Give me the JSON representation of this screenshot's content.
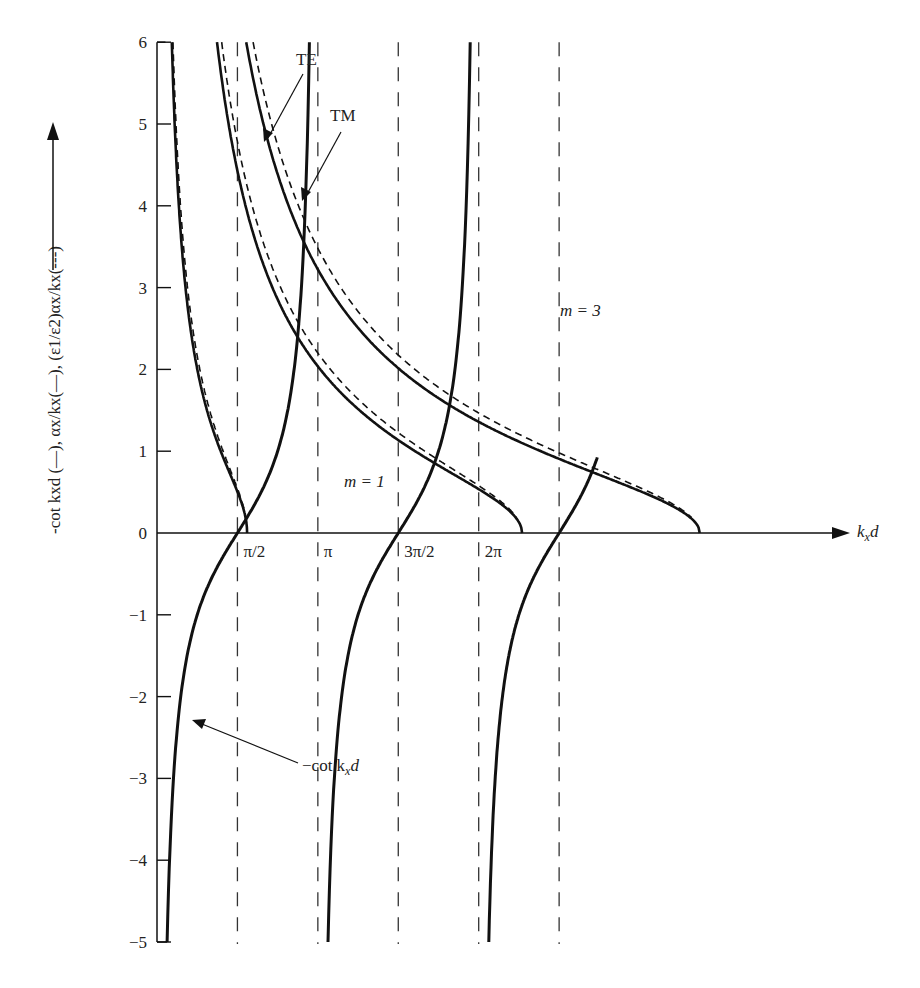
{
  "chart_data": {
    "type": "line",
    "title": "",
    "xlabel": "k_x d",
    "ylabel": "-cot k_x d (—), α_x/k_x(—), (ε1/ε2)α_x/k_x(---)",
    "ylim": [
      -5,
      6
    ],
    "xlim": [
      0,
      8.6
    ],
    "grid": false,
    "y_ticks": [
      "6",
      "5",
      "4",
      "3",
      "2",
      "1",
      "0",
      "−1",
      "−2",
      "−3",
      "−4",
      "−5"
    ],
    "y_tick_values": [
      6,
      5,
      4,
      3,
      2,
      1,
      0,
      -1,
      -2,
      -3,
      -4,
      -5
    ],
    "x_ticks": [
      "π/2",
      "π",
      "3π/2",
      "2π"
    ],
    "x_tick_values": [
      1.5708,
      3.1416,
      4.7124,
      6.2832
    ],
    "asymptotes_dashed_at": [
      1.5708,
      3.1416,
      4.7124,
      6.2832,
      7.854
    ],
    "series": [
      {
        "name": "-cot k_x d",
        "style": "solid-thick",
        "description": "branches between poles at 0, π, 2π, 3π"
      },
      {
        "name": "α_x/k_x (TE), V≈1.76",
        "style": "solid",
        "ends_at_x": 1.76
      },
      {
        "name": "(ε1/ε2)α_x/k_x (TM), V≈1.76",
        "style": "dashed",
        "ends_at_x": 1.76
      },
      {
        "name": "α_x/k_x (TE), V≈7.13",
        "style": "solid",
        "ends_at_x": 7.13
      },
      {
        "name": "(ε1/ε2)α_x/k_x (TM), V≈7.13",
        "style": "dashed",
        "ends_at_x": 7.13
      },
      {
        "name": "α_x/k_x (TE), V≈10.6",
        "style": "solid",
        "ends_at_x": 10.6
      },
      {
        "name": "(ε1/ε2)α_x/k_x (TM), V≈10.6",
        "style": "dashed",
        "ends_at_x": 10.6
      }
    ],
    "annotations": [
      {
        "text": "TE",
        "points_to": "solid decaying curve"
      },
      {
        "text": "TM",
        "points_to": "dashed decaying curve"
      },
      {
        "text": "m = 1",
        "region": "between π/2 and π"
      },
      {
        "text": "m = 3",
        "region": "between 3π/2 and 2π"
      },
      {
        "text": "−cot k_x d",
        "points_to": "first -cot branch"
      }
    ]
  },
  "labels": {
    "y_axis_title": "-cot k",
    "y_axis_title_full": "-cot kxd (—), αx/kx(—), (ε1/ε2)αx/kx(---)",
    "x_axis_title_k": "k",
    "x_axis_title_sub": "x",
    "x_axis_title_d": "d",
    "te": "TE",
    "tm": "TM",
    "m1": "m = 1",
    "m3": "m = 3",
    "cot_label": "−cot k",
    "cot_label_sub": "x",
    "cot_label_d": "d"
  }
}
